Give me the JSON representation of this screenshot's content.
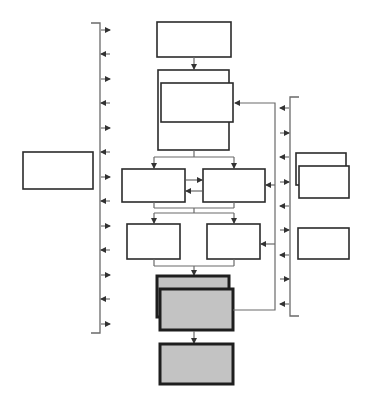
{
  "diagram": {
    "title": "",
    "colors": {
      "box_stroke": "#2b2b2b",
      "box_fill": "#ffffff",
      "highlight_fill": "#c3c3c3",
      "highlight_stroke": "#1e1e1e",
      "connector": "#6a6a6a"
    },
    "left_bracket": {
      "x": 100,
      "y_top": 23,
      "y_bottom": 333,
      "arrows": [
        {
          "y": 30,
          "dir": "right"
        },
        {
          "y": 54,
          "dir": "left"
        },
        {
          "y": 79,
          "dir": "right"
        },
        {
          "y": 103,
          "dir": "left"
        },
        {
          "y": 128,
          "dir": "right"
        },
        {
          "y": 152,
          "dir": "left"
        },
        {
          "y": 177,
          "dir": "right"
        },
        {
          "y": 201,
          "dir": "left"
        },
        {
          "y": 226,
          "dir": "right"
        },
        {
          "y": 250,
          "dir": "left"
        },
        {
          "y": 275,
          "dir": "right"
        },
        {
          "y": 299,
          "dir": "left"
        },
        {
          "y": 324,
          "dir": "right"
        }
      ]
    },
    "right_bracket": {
      "x": 290,
      "y_top": 97,
      "y_bottom": 316,
      "arrows": [
        {
          "y": 108,
          "dir": "left"
        },
        {
          "y": 133,
          "dir": "right"
        },
        {
          "y": 157,
          "dir": "left"
        },
        {
          "y": 182,
          "dir": "right"
        },
        {
          "y": 206,
          "dir": "left"
        },
        {
          "y": 230,
          "dir": "right"
        },
        {
          "y": 255,
          "dir": "left"
        },
        {
          "y": 279,
          "dir": "right"
        },
        {
          "y": 304,
          "dir": "left"
        }
      ]
    },
    "nodes": [
      {
        "id": "left-box",
        "label": "",
        "style": "white"
      },
      {
        "id": "top-box",
        "label": "",
        "style": "white"
      },
      {
        "id": "stack-box-back",
        "label": "",
        "style": "white"
      },
      {
        "id": "stack-box-front",
        "label": "",
        "style": "white"
      },
      {
        "id": "row1-left",
        "label": "",
        "style": "white"
      },
      {
        "id": "row1-right",
        "label": "",
        "style": "white"
      },
      {
        "id": "row2-left",
        "label": "",
        "style": "white"
      },
      {
        "id": "row2-right",
        "label": "",
        "style": "white"
      },
      {
        "id": "gray-stack-back",
        "label": "",
        "style": "gray"
      },
      {
        "id": "gray-stack-front",
        "label": "",
        "style": "gray"
      },
      {
        "id": "gray-bottom",
        "label": "",
        "style": "gray"
      },
      {
        "id": "right-stack-back",
        "label": "",
        "style": "white"
      },
      {
        "id": "right-stack-front",
        "label": "",
        "style": "white"
      },
      {
        "id": "right-single",
        "label": "",
        "style": "white"
      }
    ]
  }
}
